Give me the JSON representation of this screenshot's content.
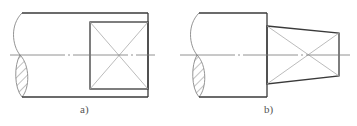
{
  "figure": {
    "panels": [
      {
        "id": "a",
        "label": "a)",
        "description": "Shaft end with square section (flats)"
      },
      {
        "id": "b",
        "label": "b)",
        "description": "Shaft end with tapered square section"
      }
    ],
    "colors": {
      "outline": "#3a3a3a",
      "thin_line": "#9a9a9a",
      "center_line": "#777777",
      "hatch": "#666666"
    }
  }
}
